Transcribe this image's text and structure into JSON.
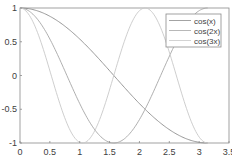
{
  "chart_data": {
    "type": "line",
    "title": "",
    "xlabel": "",
    "ylabel": "",
    "xlim": [
      0,
      3.5
    ],
    "ylim": [
      -1,
      1
    ],
    "grid": false,
    "legend_position": "upper right",
    "x_ticks": [
      "0",
      "0.5",
      "1",
      "1.5",
      "2",
      "2.5",
      "3",
      "3.5"
    ],
    "y_ticks": [
      "1",
      "0.5",
      "0",
      "-0.5",
      "-1"
    ],
    "x_domain": [
      0,
      3.14159
    ],
    "series": [
      {
        "name": "cos(x)",
        "function": "cos(x)",
        "color": "#8c8c8c",
        "x": [
          0,
          0.5,
          1,
          1.5,
          2,
          2.5,
          3,
          3.14
        ],
        "values": [
          1,
          0.878,
          0.54,
          0.071,
          -0.416,
          -0.801,
          -0.99,
          -1
        ]
      },
      {
        "name": "cos(2x)",
        "function": "cos(2x)",
        "color": "#a6a6a6",
        "x": [
          0,
          0.5,
          1,
          1.5,
          2,
          2.5,
          3,
          3.14
        ],
        "values": [
          1,
          0.54,
          -0.416,
          -0.99,
          -0.654,
          0.284,
          0.96,
          1
        ]
      },
      {
        "name": "cos(3x)",
        "function": "cos(3x)",
        "color": "#c8c8c8",
        "x": [
          0,
          0.5,
          1,
          1.5,
          2,
          2.5,
          3,
          3.14
        ],
        "values": [
          1,
          0.071,
          -0.99,
          -0.211,
          0.96,
          0.347,
          -0.911,
          -1
        ]
      }
    ]
  },
  "legend": {
    "items": [
      {
        "label": "cos(x)"
      },
      {
        "label": "cos(2x)"
      },
      {
        "label": "cos(3x)"
      }
    ]
  },
  "axes": {
    "x_tick_labels": [
      "0",
      "0.5",
      "1",
      "1.5",
      "2",
      "2.5",
      "3",
      "3.5"
    ],
    "y_tick_labels": [
      "1",
      "0.5",
      "0",
      "-0.5",
      "-1"
    ]
  }
}
